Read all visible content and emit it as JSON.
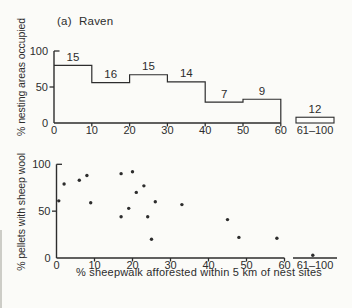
{
  "figure": {
    "title": "(a) Raven",
    "colors": {
      "ink": "#2d2d2d",
      "paper": "#fbfbf8"
    }
  },
  "chart_data": [
    {
      "type": "bar",
      "subtype": "step-histogram",
      "panel": "top",
      "title": "(a) Raven",
      "ylabel": "% nesting areas occupied",
      "ylim": [
        0,
        100
      ],
      "yticks": [
        "0",
        "50",
        "100"
      ],
      "xticks": [
        "0",
        "10",
        "20",
        "30",
        "40",
        "50",
        "60"
      ],
      "grid": false,
      "bins": [
        {
          "range": "0-10",
          "pct_occupied": 80,
          "n_areas": "15"
        },
        {
          "range": "10-20",
          "pct_occupied": 56,
          "n_areas": "16"
        },
        {
          "range": "20-30",
          "pct_occupied": 67,
          "n_areas": "15"
        },
        {
          "range": "30-40",
          "pct_occupied": 57,
          "n_areas": "14"
        },
        {
          "range": "40-50",
          "pct_occupied": 29,
          "n_areas": "7"
        },
        {
          "range": "50-60",
          "pct_occupied": 33,
          "n_areas": "9"
        }
      ],
      "offscale_bin": {
        "label": "61–100",
        "pct_occupied": 8,
        "n_areas": "12"
      }
    },
    {
      "type": "scatter",
      "panel": "bottom",
      "xlabel": "% sheepwalk afforested within 5 km of nest sites",
      "ylabel": "% pellets with sheep wool",
      "xlim": [
        0,
        60
      ],
      "ylim": [
        0,
        100
      ],
      "yticks": [
        "0",
        "50",
        "100"
      ],
      "xticks": [
        "0",
        "10",
        "20",
        "30",
        "40",
        "50",
        "60"
      ],
      "grid": false,
      "points": [
        [
          0.6,
          61
        ],
        [
          2,
          79
        ],
        [
          6,
          83
        ],
        [
          8,
          88
        ],
        [
          9,
          59
        ],
        [
          17,
          90
        ],
        [
          17,
          44
        ],
        [
          19,
          53
        ],
        [
          20,
          92
        ],
        [
          21,
          70
        ],
        [
          23,
          77
        ],
        [
          24,
          44
        ],
        [
          25,
          20
        ],
        [
          26,
          60
        ],
        [
          33,
          57
        ],
        [
          45,
          41
        ],
        [
          48,
          22
        ],
        [
          58,
          21
        ]
      ],
      "offscale_bin": {
        "label": "61–100",
        "points": [
          {
            "frac": 0.45,
            "y": 3
          }
        ]
      }
    }
  ]
}
